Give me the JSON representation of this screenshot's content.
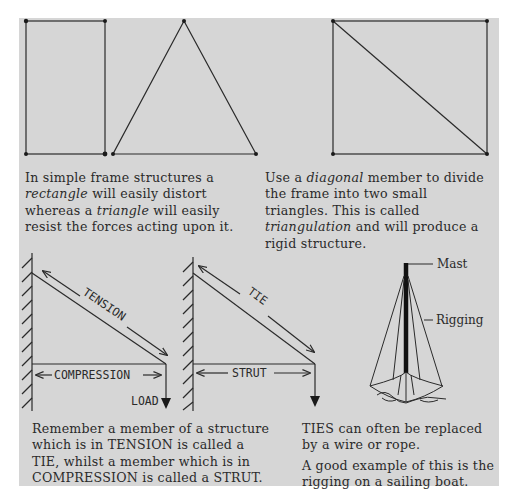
{
  "panel": {
    "background": "#d6d6d6",
    "ink": "#2a2a2a"
  },
  "top_left": {
    "lines": [
      [
        "In simple frame structures a"
      ],
      [
        "",
        "rectangle",
        " will easily distort"
      ],
      [
        "whereas a ",
        "triangle",
        " will easily"
      ],
      [
        "resist the forces acting upon it."
      ]
    ],
    "line1": "In simple frame structures a",
    "line2_em": "rectangle",
    "line2_rest": " will easily distort",
    "line3_pre": "whereas a ",
    "line3_em": "triangle",
    "line3_rest": " will easily",
    "line4": "resist the forces acting upon it."
  },
  "top_right": {
    "line1_pre": "Use a ",
    "line1_em": "diagonal",
    "line1_rest": " member to divide",
    "line2": "the frame into two small",
    "line3": "triangles. This is called",
    "line4_em": "triangulation",
    "line4_rest": " and will produce a",
    "line5": "rigid structure."
  },
  "diagram_labels": {
    "tension": "TENSION",
    "compression": "COMPRESSION",
    "load": "LOAD",
    "tie": "TIE",
    "strut": "STRUT",
    "mast": "Mast",
    "rigging": "Rigging"
  },
  "bottom_left": {
    "line1": "Remember a member of a structure",
    "line2": "which is in TENSION is called a",
    "line3": "TIE, whilst a member which is in",
    "line4": "COMPRESSION is called a STRUT."
  },
  "bottom_right": {
    "line1": "TIES can often be replaced",
    "line2": "by a wire or rope.",
    "line3": "A good example of this is the",
    "line4": "rigging on a sailing boat."
  }
}
